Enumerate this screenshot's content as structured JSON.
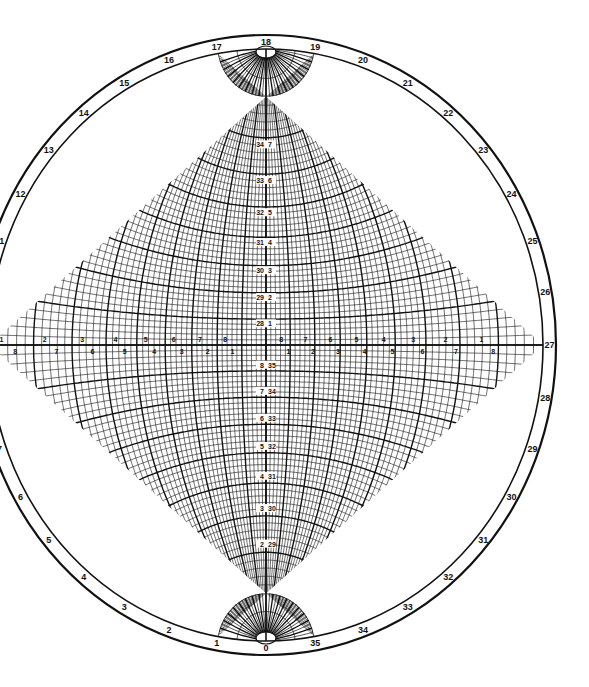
{
  "diagram": {
    "type": "wulff-stereographic-net",
    "colors": {
      "background": "#ffffff",
      "ink": "#111111"
    },
    "geometry": {
      "center_x": 266,
      "center_y": 345,
      "net_rx": 277,
      "net_ry": 296,
      "rim_rx": 290,
      "rim_ry": 310,
      "minor_step_deg": 2,
      "major_step_deg": 10
    },
    "rim_labels": {
      "description": "Outer rim numbering 0-35 (x10 degrees), 0 at bottom, increasing clockwise via left",
      "values": [
        "0",
        "1",
        "2",
        "3",
        "4",
        "5",
        "6",
        "7",
        "8",
        "9",
        "10",
        "11",
        "12",
        "13",
        "14",
        "15",
        "16",
        "17",
        "18",
        "19",
        "20",
        "21",
        "22",
        "23",
        "24",
        "25",
        "26",
        "27",
        "28",
        "29",
        "30",
        "31",
        "32",
        "33",
        "34",
        "35"
      ],
      "visible": [
        "0",
        "1",
        "2",
        "3",
        "4",
        "5",
        "6",
        "12",
        "13",
        "14",
        "15",
        "16",
        "17",
        "18",
        "19",
        "20",
        "21",
        "22",
        "23",
        "24",
        "25",
        "26",
        "27",
        "28",
        "29",
        "30",
        "31",
        "32",
        "33",
        "34",
        "35"
      ]
    },
    "central_meridian_labels": {
      "upper": [
        {
          "left": "28",
          "right": "1"
        },
        {
          "left": "29",
          "right": "2"
        },
        {
          "left": "30",
          "right": "3"
        },
        {
          "left": "31",
          "right": "4"
        },
        {
          "left": "32",
          "right": "5"
        },
        {
          "left": "33",
          "right": "6"
        },
        {
          "left": "34",
          "right": "7"
        }
      ],
      "lower": [
        {
          "left": "8",
          "right": "35"
        },
        {
          "left": "7",
          "right": "34"
        },
        {
          "left": "6",
          "right": "33"
        },
        {
          "left": "5",
          "right": "32"
        },
        {
          "left": "4",
          "right": "31"
        },
        {
          "left": "3",
          "right": "30"
        },
        {
          "left": "2",
          "right": "29"
        }
      ]
    },
    "equator_labels": {
      "left_upper": [
        "1",
        "2",
        "3",
        "4",
        "5",
        "6",
        "7",
        "8"
      ],
      "left_lower": [
        "8",
        "7",
        "6",
        "5",
        "4",
        "3",
        "2",
        "1"
      ],
      "right_upper": [
        "8",
        "7",
        "6",
        "5",
        "4",
        "3",
        "2",
        "1"
      ],
      "right_lower": [
        "1",
        "2",
        "3",
        "4",
        "5",
        "6",
        "7",
        "8"
      ]
    }
  }
}
